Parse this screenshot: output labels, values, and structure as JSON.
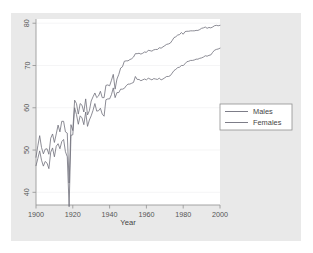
{
  "chart_data": {
    "type": "line",
    "title": "",
    "subtitle": "",
    "xlabel": "Year",
    "ylabel": "",
    "xlim": [
      1900,
      2000
    ],
    "ylim": [
      37,
      81
    ],
    "xticks": [
      1900,
      1920,
      1940,
      1960,
      1980,
      2000
    ],
    "yticks": [
      40,
      50,
      60,
      70,
      80
    ],
    "xtick_labels": [
      "1900",
      "1920",
      "1940",
      "1960",
      "1980",
      "2000"
    ],
    "ytick_labels": [
      "40",
      "50",
      "60",
      "70",
      "80"
    ],
    "grid": "horizontal-faint",
    "legend_position": "right-outside",
    "line_color": "#6e6e7a",
    "plot_background": "#ffffff",
    "figure_background": "#e9e9e9",
    "axis_color": "#9a9a9a",
    "series": [
      {
        "name": "Males",
        "x": [
          1900,
          1901,
          1902,
          1903,
          1904,
          1905,
          1906,
          1907,
          1908,
          1909,
          1910,
          1911,
          1912,
          1913,
          1914,
          1915,
          1916,
          1917,
          1918,
          1919,
          1920,
          1921,
          1922,
          1923,
          1924,
          1925,
          1926,
          1927,
          1928,
          1929,
          1930,
          1931,
          1932,
          1933,
          1934,
          1935,
          1936,
          1937,
          1938,
          1939,
          1940,
          1941,
          1942,
          1943,
          1944,
          1945,
          1946,
          1947,
          1948,
          1949,
          1950,
          1951,
          1952,
          1953,
          1954,
          1955,
          1956,
          1957,
          1958,
          1959,
          1960,
          1961,
          1962,
          1963,
          1964,
          1965,
          1966,
          1967,
          1968,
          1969,
          1970,
          1971,
          1972,
          1973,
          1974,
          1975,
          1976,
          1977,
          1978,
          1979,
          1980,
          1981,
          1982,
          1983,
          1984,
          1985,
          1986,
          1987,
          1988,
          1989,
          1990,
          1991,
          1992,
          1993,
          1994,
          1995,
          1996,
          1997,
          1998,
          1999,
          2000
        ],
        "values": [
          46.3,
          48.0,
          49.8,
          47.6,
          46.2,
          47.3,
          46.9,
          45.6,
          49.5,
          50.5,
          48.4,
          50.9,
          51.5,
          50.3,
          52.0,
          52.5,
          49.6,
          48.4,
          36.6,
          53.5,
          53.6,
          60.0,
          58.4,
          56.1,
          58.1,
          57.6,
          56.0,
          59.0,
          55.6,
          57.1,
          58.1,
          59.4,
          61.0,
          59.2,
          59.3,
          59.9,
          58.5,
          58.0,
          61.9,
          62.1,
          62.1,
          63.1,
          64.7,
          62.4,
          63.6,
          63.6,
          64.4,
          64.4,
          64.6,
          65.2,
          65.6,
          65.6,
          65.8,
          66.0,
          67.4,
          66.7,
          66.7,
          66.4,
          66.6,
          66.8,
          66.6,
          67.0,
          66.8,
          66.6,
          66.9,
          66.8,
          66.7,
          67.0,
          66.6,
          66.8,
          67.1,
          67.4,
          67.4,
          67.6,
          68.2,
          68.8,
          69.1,
          69.5,
          69.6,
          70.0,
          70.0,
          70.4,
          70.9,
          71.0,
          71.2,
          71.2,
          71.3,
          71.5,
          71.5,
          71.7,
          71.8,
          72.0,
          72.3,
          72.2,
          72.4,
          72.5,
          73.1,
          73.6,
          73.8,
          73.9,
          74.1
        ]
      },
      {
        "name": "Females",
        "x": [
          1900,
          1901,
          1902,
          1903,
          1904,
          1905,
          1906,
          1907,
          1908,
          1909,
          1910,
          1911,
          1912,
          1913,
          1914,
          1915,
          1916,
          1917,
          1918,
          1919,
          1920,
          1921,
          1922,
          1923,
          1924,
          1925,
          1926,
          1927,
          1928,
          1929,
          1930,
          1931,
          1932,
          1933,
          1934,
          1935,
          1936,
          1937,
          1938,
          1939,
          1940,
          1941,
          1942,
          1943,
          1944,
          1945,
          1946,
          1947,
          1948,
          1949,
          1950,
          1951,
          1952,
          1953,
          1954,
          1955,
          1956,
          1957,
          1958,
          1959,
          1960,
          1961,
          1962,
          1963,
          1964,
          1965,
          1966,
          1967,
          1968,
          1969,
          1970,
          1971,
          1972,
          1973,
          1974,
          1975,
          1976,
          1977,
          1978,
          1979,
          1980,
          1981,
          1982,
          1983,
          1984,
          1985,
          1986,
          1987,
          1988,
          1989,
          1990,
          1991,
          1992,
          1993,
          1994,
          1995,
          1996,
          1997,
          1998,
          1999,
          2000
        ],
        "values": [
          48.3,
          51.0,
          53.4,
          50.6,
          49.1,
          50.2,
          50.3,
          49.0,
          52.8,
          53.8,
          51.8,
          53.8,
          55.9,
          54.3,
          56.8,
          56.8,
          54.3,
          54.0,
          42.2,
          56.0,
          54.6,
          61.8,
          61.0,
          58.5,
          61.0,
          60.6,
          59.0,
          62.1,
          58.3,
          59.3,
          61.6,
          62.6,
          63.5,
          62.4,
          62.8,
          63.9,
          62.4,
          62.4,
          65.3,
          65.4,
          65.2,
          66.5,
          67.9,
          64.4,
          66.8,
          67.9,
          69.4,
          69.7,
          71.0,
          71.1,
          71.1,
          71.4,
          71.6,
          72.0,
          72.8,
          72.8,
          72.9,
          72.7,
          72.9,
          73.2,
          73.1,
          73.6,
          73.5,
          73.4,
          73.7,
          73.8,
          73.8,
          74.2,
          74.1,
          74.4,
          74.7,
          75.0,
          75.1,
          75.3,
          75.9,
          76.6,
          76.8,
          77.2,
          77.3,
          77.8,
          77.4,
          78.0,
          78.1,
          78.1,
          78.2,
          78.2,
          78.2,
          78.3,
          78.3,
          78.5,
          78.8,
          78.9,
          79.1,
          78.8,
          79.0,
          78.9,
          79.1,
          79.4,
          79.5,
          79.4,
          79.5
        ]
      }
    ]
  },
  "legend": {
    "items": [
      {
        "label": "Males"
      },
      {
        "label": "Females"
      }
    ]
  },
  "axes": {
    "x_title": "Year"
  }
}
